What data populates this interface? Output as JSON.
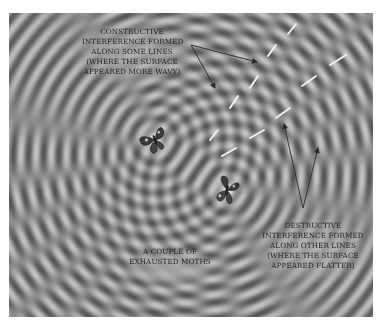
{
  "figure": {
    "background_color": "#8c8c8c",
    "wave_light_color": "#d2d2d2",
    "wave_dark_color": "#5a5a5a",
    "sources": [
      {
        "name": "moth-1",
        "x": 155,
        "y": 140
      },
      {
        "name": "moth-2",
        "x": 227,
        "y": 190
      }
    ]
  },
  "annotations": {
    "constructive": {
      "lines": [
        "Constructive",
        "interference formed",
        "along some lines",
        "(where the surface",
        "appeared more wavy)"
      ]
    },
    "moths": {
      "lines": [
        "A couple of",
        "exhausted moths"
      ]
    },
    "destructive": {
      "lines": [
        "Destructive",
        "interference formed",
        "along other lines",
        "(where the surface",
        "appeared flatter)"
      ]
    }
  },
  "dashed_lines": [
    {
      "name": "constructive-line",
      "color": "#f2f2f2",
      "segments": [
        [
          210,
          140,
          218,
          130
        ],
        [
          230,
          108,
          238,
          96
        ],
        [
          250,
          88,
          258,
          76
        ],
        [
          268,
          56,
          276,
          45
        ],
        [
          288,
          34,
          296,
          24
        ]
      ]
    },
    {
      "name": "destructive-line",
      "color": "#f2f2f2",
      "segments": [
        [
          222,
          156,
          236,
          148
        ],
        [
          250,
          138,
          264,
          130
        ],
        [
          276,
          118,
          290,
          108
        ],
        [
          302,
          86,
          316,
          76
        ],
        [
          330,
          65,
          346,
          55
        ]
      ]
    }
  ],
  "arrows": {
    "color": "#2a2a2a",
    "constructive": {
      "origin": [
        191,
        45
      ],
      "tips": [
        [
          257,
          62
        ],
        [
          215,
          88
        ]
      ]
    },
    "destructive": {
      "origin": [
        303,
        208
      ],
      "tips": [
        [
          284,
          124
        ],
        [
          318,
          148
        ]
      ]
    }
  }
}
